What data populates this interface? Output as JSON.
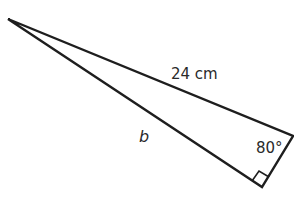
{
  "diagram": {
    "type": "right-triangle",
    "vertices": {
      "apex": [
        8,
        19
      ],
      "right_corner": [
        293,
        136
      ],
      "right_angle": [
        262,
        187
      ]
    },
    "labels": {
      "hypotenuse": "24 cm",
      "side_b": "b",
      "angle": "80°"
    },
    "stroke_color": "#1e1e1e",
    "text_color": "#2a2a2a"
  }
}
